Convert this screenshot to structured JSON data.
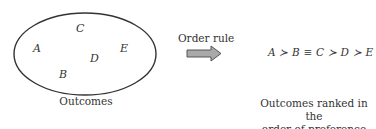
{
  "outcomes_set": {
    "items": [
      "A",
      "B",
      "C",
      "D",
      "E"
    ],
    "caption": "Outcomes"
  },
  "arrow": {
    "label": "Order rule",
    "fill": "#a9a9a9",
    "stroke": "#555555"
  },
  "ranking": {
    "expression": "A ≻ B ≡ C ≻ D ≻ E",
    "caption_line1": "Outcomes ranked in the",
    "caption_line2": "order of preference"
  }
}
